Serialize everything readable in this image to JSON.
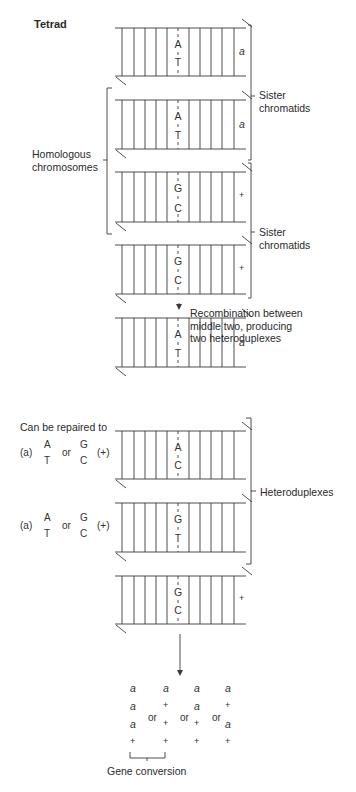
{
  "title": "Tetrad",
  "colors": {
    "line": "#3a3a3a",
    "text": "#2a2a2a",
    "background": "#ffffff"
  },
  "labels": {
    "homologous": [
      "Homologous",
      "chromosomes"
    ],
    "sister_top": [
      "Sister",
      "chromatids"
    ],
    "sister_bottom": [
      "Sister",
      "chromatids"
    ],
    "recombination": [
      "Recombination between",
      "middle two, producing",
      "two heteroduplexes"
    ],
    "heteroduplexes": "Heteroduplexes",
    "can_be_repaired": "Can be repaired to",
    "gene_conversion": "Gene conversion"
  },
  "tetrad": [
    {
      "top": "A",
      "bottom": "T",
      "allele": "a"
    },
    {
      "top": "A",
      "bottom": "T",
      "allele": "a"
    },
    {
      "top": "G",
      "bottom": "C",
      "allele": "+"
    },
    {
      "top": "G",
      "bottom": "C",
      "allele": "+"
    }
  ],
  "after_recombination": [
    {
      "top": "A",
      "bottom": "T",
      "allele": "a"
    },
    {
      "top": "A",
      "bottom": "C",
      "allele": ""
    },
    {
      "top": "G",
      "bottom": "T",
      "allele": ""
    },
    {
      "top": "G",
      "bottom": "C",
      "allele": "+"
    }
  ],
  "repair_options": [
    {
      "a_label": "(a)",
      "opt1_top": "A",
      "opt1_bottom": "T",
      "or": "or",
      "opt2_top": "G",
      "opt2_bottom": "C",
      "plus_label": "(+)"
    },
    {
      "a_label": "(a)",
      "opt1_top": "A",
      "opt1_bottom": "T",
      "or": "or",
      "opt2_top": "G",
      "opt2_bottom": "C",
      "plus_label": "(+)"
    }
  ],
  "outcomes": {
    "columns": [
      [
        "a",
        "a",
        "a",
        "+"
      ],
      [
        "a",
        "+",
        "+",
        "+"
      ],
      [
        "a",
        "a",
        "+",
        "+"
      ],
      [
        "a",
        "+",
        "a",
        "+"
      ]
    ],
    "or_label": "or"
  }
}
